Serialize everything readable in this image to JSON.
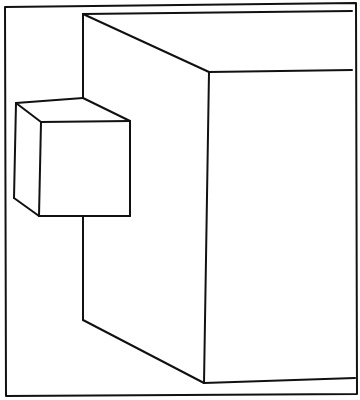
{
  "diagram": {
    "stroke_color": "#111111",
    "background": "#ffffff",
    "frame": {
      "points": [
        [
          5,
          7
        ],
        [
          356,
          3
        ],
        [
          357,
          394
        ],
        [
          6,
          396
        ]
      ]
    },
    "large_cube": {
      "lines": [
        [
          [
            83,
            14
          ],
          [
            352,
            11
          ]
        ],
        [
          [
            83,
            14
          ],
          [
            209,
            72
          ]
        ],
        [
          [
            209,
            72
          ],
          [
            352,
            70
          ]
        ],
        [
          [
            83,
            14
          ],
          [
            83,
            98
          ]
        ],
        [
          [
            83,
            216
          ],
          [
            83,
            320
          ]
        ],
        [
          [
            83,
            320
          ],
          [
            204,
            383
          ]
        ],
        [
          [
            209,
            72
          ],
          [
            204,
            383
          ]
        ],
        [
          [
            204,
            383
          ],
          [
            355,
            378
          ]
        ]
      ]
    },
    "small_cube": {
      "lines": [
        [
          [
            16,
            103
          ],
          [
            83,
            98
          ]
        ],
        [
          [
            83,
            98
          ],
          [
            130,
            121
          ]
        ],
        [
          [
            16,
            103
          ],
          [
            41,
            122
          ]
        ],
        [
          [
            41,
            122
          ],
          [
            130,
            121
          ]
        ],
        [
          [
            16,
            103
          ],
          [
            14,
            198
          ]
        ],
        [
          [
            14,
            198
          ],
          [
            39,
            216
          ]
        ],
        [
          [
            41,
            122
          ],
          [
            39,
            216
          ]
        ],
        [
          [
            130,
            121
          ],
          [
            130,
            216
          ]
        ],
        [
          [
            39,
            216
          ],
          [
            130,
            216
          ]
        ]
      ]
    }
  }
}
